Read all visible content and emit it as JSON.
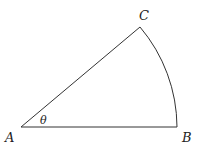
{
  "diagram": {
    "type": "circular-sector",
    "stroke_color": "#333333",
    "vertices": {
      "A": {
        "label": "A",
        "x": 21,
        "y": 127
      },
      "B": {
        "label": "B",
        "x": 177,
        "y": 127
      },
      "C": {
        "label": "C",
        "x": 140,
        "y": 27
      }
    },
    "angle": {
      "label": "θ",
      "at": "A"
    },
    "edges": [
      {
        "from": "A",
        "to": "B",
        "kind": "segment"
      },
      {
        "from": "A",
        "to": "C",
        "kind": "segment"
      },
      {
        "from": "C",
        "to": "B",
        "kind": "arc",
        "center": "A"
      }
    ]
  }
}
